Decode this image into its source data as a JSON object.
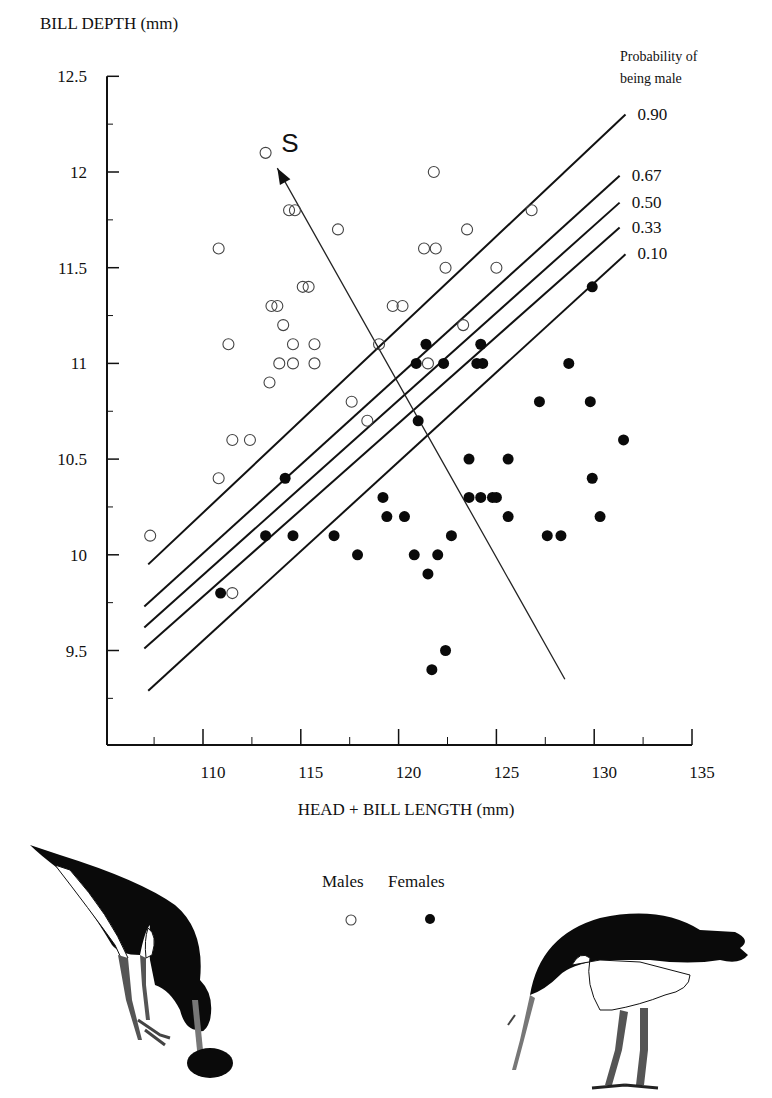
{
  "chart_data": {
    "type": "scatter",
    "title": "",
    "xlabel": "HEAD + BILL LENGTH (mm)",
    "ylabel": "BILL DEPTH (mm)",
    "xlim": [
      105.2,
      135
    ],
    "ylim": [
      9.0,
      12.5
    ],
    "x_ticks": [
      110,
      115,
      120,
      125,
      130,
      135
    ],
    "y_ticks": [
      9.5,
      10,
      10.5,
      11,
      11.5,
      12,
      12.5
    ],
    "y_tick_labels": [
      "9.5",
      "10",
      "10.5",
      "11",
      "11.5",
      "12",
      "12.5"
    ],
    "grid": false,
    "legend": {
      "position": "bottom-center",
      "entries": [
        "Males",
        "Females"
      ]
    },
    "series": [
      {
        "name": "Males",
        "marker": "open-circle",
        "points": [
          [
            107.3,
            10.1
          ],
          [
            110.8,
            11.6
          ],
          [
            111.3,
            11.1
          ],
          [
            111.5,
            10.6
          ],
          [
            112.4,
            10.6
          ],
          [
            110.8,
            10.4
          ],
          [
            111.5,
            9.8
          ],
          [
            113.2,
            12.1
          ],
          [
            114.4,
            11.8
          ],
          [
            114.7,
            11.8
          ],
          [
            113.5,
            11.3
          ],
          [
            113.8,
            11.3
          ],
          [
            114.1,
            11.2
          ],
          [
            113.9,
            11.0
          ],
          [
            114.6,
            11.0
          ],
          [
            114.6,
            11.1
          ],
          [
            113.4,
            10.9
          ],
          [
            115.7,
            11.0
          ],
          [
            115.7,
            11.1
          ],
          [
            115.1,
            11.4
          ],
          [
            115.4,
            11.4
          ],
          [
            116.9,
            11.7
          ],
          [
            121.8,
            12.0
          ],
          [
            121.3,
            11.6
          ],
          [
            121.9,
            11.6
          ],
          [
            122.4,
            11.5
          ],
          [
            123.5,
            11.7
          ],
          [
            125.0,
            11.5
          ],
          [
            126.8,
            11.8
          ],
          [
            119.7,
            11.3
          ],
          [
            120.2,
            11.3
          ],
          [
            119.0,
            11.1
          ],
          [
            117.6,
            10.8
          ],
          [
            118.4,
            10.7
          ],
          [
            121.5,
            11.0
          ],
          [
            123.3,
            11.2
          ]
        ]
      },
      {
        "name": "Females",
        "marker": "filled-circle",
        "points": [
          [
            110.9,
            9.8
          ],
          [
            113.2,
            10.1
          ],
          [
            114.2,
            10.4
          ],
          [
            114.6,
            10.1
          ],
          [
            116.7,
            10.1
          ],
          [
            117.9,
            10.0
          ],
          [
            119.2,
            10.3
          ],
          [
            119.4,
            10.2
          ],
          [
            120.3,
            10.2
          ],
          [
            120.8,
            10.0
          ],
          [
            121.5,
            9.9
          ],
          [
            122.0,
            10.0
          ],
          [
            122.7,
            10.1
          ],
          [
            120.9,
            11.0
          ],
          [
            121.0,
            10.7
          ],
          [
            121.4,
            11.1
          ],
          [
            122.3,
            11.0
          ],
          [
            124.2,
            11.1
          ],
          [
            124.0,
            11.0
          ],
          [
            124.3,
            11.0
          ],
          [
            123.6,
            10.5
          ],
          [
            123.6,
            10.3
          ],
          [
            124.2,
            10.3
          ],
          [
            124.8,
            10.3
          ],
          [
            125.0,
            10.3
          ],
          [
            125.6,
            10.5
          ],
          [
            125.6,
            10.2
          ],
          [
            127.2,
            10.8
          ],
          [
            127.6,
            10.1
          ],
          [
            128.3,
            10.1
          ],
          [
            128.7,
            11.0
          ],
          [
            129.8,
            10.8
          ],
          [
            129.9,
            10.4
          ],
          [
            130.3,
            10.2
          ],
          [
            129.9,
            11.4
          ],
          [
            131.5,
            10.6
          ],
          [
            121.7,
            9.4
          ],
          [
            122.4,
            9.5
          ]
        ]
      }
    ],
    "probability_lines": {
      "title": "Probability of being male",
      "lines": [
        {
          "label": "0.90",
          "from": [
            107.2,
            9.95
          ],
          "to": [
            131.6,
            12.3
          ]
        },
        {
          "label": "0.67",
          "from": [
            107.0,
            9.73
          ],
          "to": [
            131.3,
            11.98
          ]
        },
        {
          "label": "0.50",
          "from": [
            107.0,
            9.62
          ],
          "to": [
            131.3,
            11.84
          ]
        },
        {
          "label": "0.33",
          "from": [
            107.0,
            9.51
          ],
          "to": [
            131.3,
            11.71
          ]
        },
        {
          "label": "0.10",
          "from": [
            107.2,
            9.29
          ],
          "to": [
            131.6,
            11.57
          ]
        }
      ]
    },
    "annotations": [
      {
        "type": "arrow",
        "label": "S",
        "from": [
          128.5,
          9.35
        ],
        "to": [
          113.8,
          12.02
        ]
      }
    ]
  },
  "labels": {
    "y_axis_title": "BILL DEPTH (mm)",
    "x_axis_title": "HEAD + BILL LENGTH (mm)",
    "prob_title_line1": "Probability of",
    "prob_title_line2": "being male",
    "arrow_label": "S",
    "legend_males": "Males",
    "legend_females": "Females"
  },
  "illustrations": [
    {
      "name": "oystercatcher-feeding-left",
      "description": "bird probing with bill at a shell"
    },
    {
      "name": "oystercatcher-feeding-right",
      "description": "bird probing ground with long bill"
    }
  ]
}
